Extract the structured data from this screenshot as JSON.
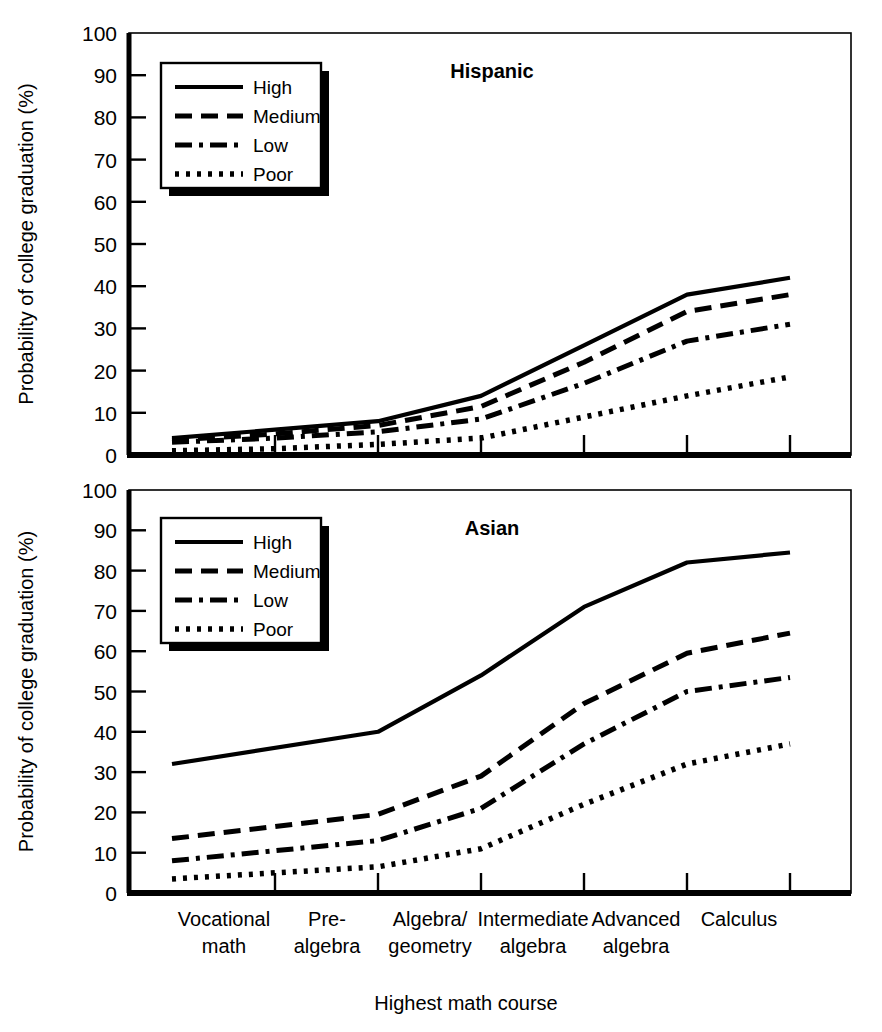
{
  "figure": {
    "axis_label_y": "Probability of college graduation (%)",
    "axis_label_x": "Highest math course"
  },
  "panels": [
    {
      "title": "Hispanic"
    },
    {
      "title": "Asian"
    }
  ],
  "legend": {
    "items": [
      {
        "label": "High",
        "style": "solid"
      },
      {
        "label": "Medium",
        "style": "dashed"
      },
      {
        "label": "Low",
        "style": "dashdot"
      },
      {
        "label": "Poor",
        "style": "dotted"
      }
    ]
  },
  "y_ticks": [
    "0",
    "10",
    "20",
    "30",
    "40",
    "50",
    "60",
    "70",
    "80",
    "90",
    "100"
  ],
  "x_categories": [
    {
      "line1": "Vocational",
      "line2": "math"
    },
    {
      "line1": "Pre-",
      "line2": "algebra"
    },
    {
      "line1": "Algebra/",
      "line2": "geometry"
    },
    {
      "line1": "Intermediate",
      "line2": "algebra"
    },
    {
      "line1": "Advanced",
      "line2": "algebra"
    },
    {
      "line1": "Calculus",
      "line2": ""
    }
  ],
  "colors": {
    "ink": "#000000",
    "background": "#ffffff"
  },
  "chart_data": [
    {
      "type": "line",
      "title": "Hispanic",
      "xlabel": "Highest math course",
      "ylabel": "Probability of college graduation (%)",
      "ylim": [
        0,
        100
      ],
      "ytick_step": 10,
      "grid": false,
      "legend_position": "upper-left",
      "categories": [
        "Vocational math",
        "Pre-algebra",
        "Algebra/geometry",
        "Intermediate algebra",
        "Advanced algebra",
        "Calculus"
      ],
      "series": [
        {
          "name": "High",
          "dash": "solid",
          "values": [
            4,
            6,
            8,
            14,
            26,
            38,
            42
          ]
        },
        {
          "name": "Medium",
          "dash": "dashed",
          "values": [
            3.5,
            5,
            7,
            11.5,
            22,
            34,
            38
          ]
        },
        {
          "name": "Low",
          "dash": "dashdot",
          "values": [
            3,
            4,
            5.5,
            8.5,
            17,
            27,
            31
          ]
        },
        {
          "name": "Poor",
          "dash": "dotted",
          "values": [
            1,
            1.5,
            2.5,
            4,
            9,
            14,
            18.5
          ]
        }
      ],
      "note": "Series include an extra leading vertex between Vocational math and Pre-algebra visible in the plot."
    },
    {
      "type": "line",
      "title": "Asian",
      "xlabel": "Highest math course",
      "ylabel": "Probability of college graduation (%)",
      "ylim": [
        0,
        100
      ],
      "ytick_step": 10,
      "grid": false,
      "legend_position": "upper-left",
      "categories": [
        "Vocational math",
        "Pre-algebra",
        "Algebra/geometry",
        "Intermediate algebra",
        "Advanced algebra",
        "Calculus"
      ],
      "series": [
        {
          "name": "High",
          "dash": "solid",
          "values": [
            32,
            40,
            54,
            71,
            82,
            84.5
          ]
        },
        {
          "name": "Medium",
          "dash": "dashed",
          "values": [
            13.5,
            19.5,
            29,
            47,
            59.5,
            64.5
          ]
        },
        {
          "name": "Low",
          "dash": "dashdot",
          "values": [
            8,
            13,
            21,
            37,
            50,
            53.5
          ]
        },
        {
          "name": "Poor",
          "dash": "dotted",
          "values": [
            3.5,
            6.5,
            11,
            22,
            32,
            37
          ]
        }
      ]
    }
  ]
}
